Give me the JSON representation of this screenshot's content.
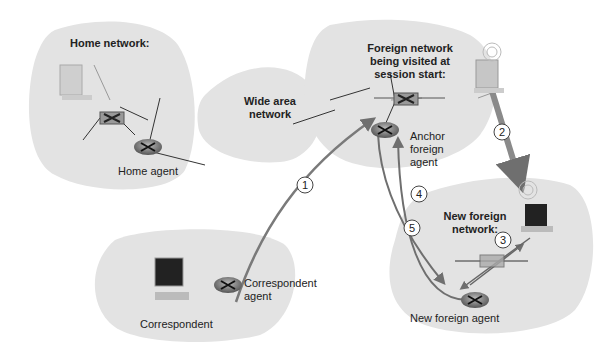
{
  "networks": {
    "home": {
      "title": "Home network:",
      "agent_label": "Home agent"
    },
    "wan": {
      "title": "Wide area network"
    },
    "foreign_start": {
      "title": "Foreign network being visited at session start:",
      "agent_label": "Anchor foreign agent"
    },
    "new_foreign": {
      "title": "New foreign network:",
      "agent_label": "New foreign agent"
    },
    "correspondent": {
      "host_label": "Correspondent",
      "agent_label": "Correspondent agent"
    }
  },
  "steps": [
    "1",
    "2",
    "3",
    "4",
    "5"
  ],
  "colors": {
    "cloud": "#e3e3e3",
    "arrow": "#7a7a7a",
    "line": "#222222"
  }
}
